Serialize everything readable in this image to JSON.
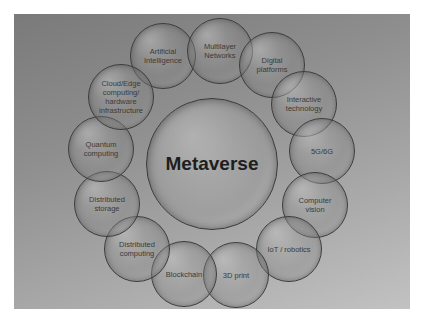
{
  "diagram": {
    "title": "Metaverse",
    "center": {
      "label": "Metaverse",
      "cx": 212,
      "cy": 164,
      "r": 66
    },
    "nodes": [
      {
        "label": "Artificial\nIntelligence",
        "cx": 163,
        "cy": 56,
        "r": 33
      },
      {
        "label": "Multilayer\nNetworks",
        "cx": 220,
        "cy": 51,
        "r": 33
      },
      {
        "label": "Digital\nplatforms",
        "cx": 272,
        "cy": 65,
        "r": 33
      },
      {
        "label": "Interactive\ntechnology",
        "cx": 304,
        "cy": 104,
        "r": 33
      },
      {
        "label": "5G/6G",
        "cx": 322,
        "cy": 151,
        "r": 33
      },
      {
        "label": "Computer\nvision",
        "cx": 315,
        "cy": 205,
        "r": 33
      },
      {
        "label": "IoT / robotics",
        "cx": 289,
        "cy": 249,
        "r": 33
      },
      {
        "label": "3D print",
        "cx": 236,
        "cy": 275,
        "r": 33
      },
      {
        "label": "Blockchain",
        "cx": 184,
        "cy": 274,
        "r": 33
      },
      {
        "label": "Distributed\ncomputing",
        "cx": 137,
        "cy": 249,
        "r": 33
      },
      {
        "label": "Distributed\nstorage",
        "cx": 107,
        "cy": 204,
        "r": 33
      },
      {
        "label": "Quantum\ncomputing",
        "cx": 101,
        "cy": 149,
        "r": 33
      },
      {
        "label": "Cloud/Edge\ncomputing/\nhardware\ninfrastructure",
        "cx": 121,
        "cy": 97,
        "r": 33
      }
    ]
  },
  "colors": {
    "background_top": "#7a7a7a",
    "background_bottom": "#c2c2c2",
    "outline": "#3c3c3c",
    "text": "#3a3a3a"
  }
}
